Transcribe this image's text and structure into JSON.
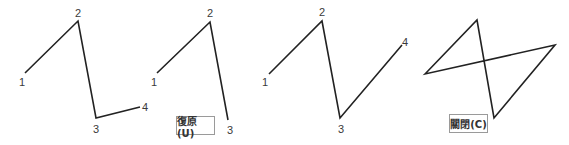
{
  "panels": [
    {
      "name": "step-1",
      "points": [
        [
          25,
          73
        ],
        [
          78,
          21
        ],
        [
          96,
          118
        ],
        [
          140,
          107
        ]
      ],
      "closed": false,
      "labels": [
        {
          "text": "1",
          "x": 22,
          "y": 82
        },
        {
          "text": "2",
          "x": 78,
          "y": 13
        },
        {
          "text": "3",
          "x": 96,
          "y": 129
        },
        {
          "text": "4",
          "x": 145,
          "y": 107
        }
      ]
    },
    {
      "name": "step-2-undo",
      "points": [
        [
          157,
          73
        ],
        [
          210,
          22
        ],
        [
          228,
          120
        ]
      ],
      "closed": false,
      "labels": [
        {
          "text": "1",
          "x": 154,
          "y": 82
        },
        {
          "text": "2",
          "x": 210,
          "y": 13
        },
        {
          "text": "3",
          "x": 230,
          "y": 130
        }
      ],
      "button": {
        "label": "復原(U)",
        "x": 176,
        "y": 116,
        "w": 39,
        "h": 19
      }
    },
    {
      "name": "step-3",
      "points": [
        [
          269,
          74
        ],
        [
          322,
          21
        ],
        [
          340,
          118
        ],
        [
          402,
          45
        ]
      ],
      "closed": false,
      "labels": [
        {
          "text": "1",
          "x": 265,
          "y": 82
        },
        {
          "text": "2",
          "x": 322,
          "y": 12
        },
        {
          "text": "3",
          "x": 341,
          "y": 129
        },
        {
          "text": "4",
          "x": 405,
          "y": 42
        }
      ]
    },
    {
      "name": "step-4-close",
      "points": [
        [
          425,
          74
        ],
        [
          477,
          20
        ],
        [
          494,
          118
        ],
        [
          555,
          45
        ]
      ],
      "closed": true,
      "labels": [],
      "button": {
        "label": "關閉(C)",
        "x": 449,
        "y": 114,
        "w": 39,
        "h": 19
      }
    }
  ],
  "style": {
    "line_color": "#222222",
    "line_width": 1.6
  }
}
